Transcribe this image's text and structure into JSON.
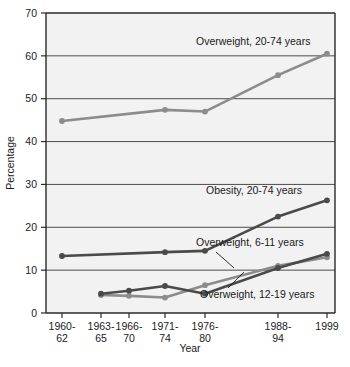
{
  "chart_data": {
    "type": "line",
    "title": "",
    "xlabel": "Year",
    "ylabel": "Percentage",
    "ylim": [
      0,
      70
    ],
    "ytick_step": 10,
    "yticks": [
      "0",
      "10",
      "20",
      "30",
      "40",
      "50",
      "60",
      "70"
    ],
    "grid": true,
    "legend_position": "inline-annotations",
    "categories": [
      "1960-62",
      "1963-65",
      "1966-70",
      "1971-74",
      "1976-80",
      "1988-94",
      "1999"
    ],
    "category_lines": [
      [
        "1960-",
        "62"
      ],
      [
        "1963-",
        "65"
      ],
      [
        "1966-",
        "70"
      ],
      [
        "1971-",
        "74"
      ],
      [
        "1976-",
        "80"
      ],
      [
        "1988-",
        "94"
      ],
      [
        "1999",
        ""
      ]
    ],
    "series": [
      {
        "name": "Overweight, 20-74 years",
        "color": "#8c8c8c",
        "points": [
          {
            "x": "1960-62",
            "y": 44.8
          },
          {
            "x": "1971-74",
            "y": 47.4
          },
          {
            "x": "1976-80",
            "y": 47.0
          },
          {
            "x": "1988-94",
            "y": 55.5
          },
          {
            "x": "1999",
            "y": 60.5
          }
        ]
      },
      {
        "name": "Obesity, 20-74 years",
        "color": "#4a4a4a",
        "points": [
          {
            "x": "1960-62",
            "y": 13.3
          },
          {
            "x": "1971-74",
            "y": 14.2
          },
          {
            "x": "1976-80",
            "y": 14.5
          },
          {
            "x": "1988-94",
            "y": 22.5
          },
          {
            "x": "1999",
            "y": 26.3
          }
        ]
      },
      {
        "name": "Overweight, 6-11 years",
        "color": "#8c8c8c",
        "points": [
          {
            "x": "1963-65",
            "y": 4.2
          },
          {
            "x": "1966-70",
            "y": 4.0
          },
          {
            "x": "1971-74",
            "y": 3.6
          },
          {
            "x": "1976-80",
            "y": 6.5
          },
          {
            "x": "1988-94",
            "y": 11.0
          },
          {
            "x": "1999",
            "y": 13.0
          }
        ]
      },
      {
        "name": "Overweight, 12-19 years",
        "color": "#4a4a4a",
        "points": [
          {
            "x": "1963-65",
            "y": 4.5
          },
          {
            "x": "1966-70",
            "y": 5.2
          },
          {
            "x": "1971-74",
            "y": 6.3
          },
          {
            "x": "1976-80",
            "y": 4.5
          },
          {
            "x": "1988-94",
            "y": 10.5
          },
          {
            "x": "1999",
            "y": 13.8
          }
        ]
      }
    ],
    "annotations": [
      {
        "label": "Overweight, 20-74 years",
        "x": 196,
        "y": 45
      },
      {
        "label": "Obesity, 20-74 years",
        "x": 206,
        "y": 194
      },
      {
        "label": "Overweight, 6-11 years",
        "x": 196,
        "y": 246
      },
      {
        "label": "Overweight, 12-19 years",
        "x": 200,
        "y": 298
      }
    ]
  }
}
